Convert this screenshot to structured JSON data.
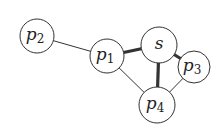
{
  "diagram": {
    "type": "graph",
    "nodes": [
      {
        "id": "p2",
        "base": "p",
        "sub": "2",
        "x": 37,
        "y": 36,
        "r": 17
      },
      {
        "id": "p1",
        "base": "p",
        "sub": "1",
        "x": 107,
        "y": 56,
        "r": 17
      },
      {
        "id": "s",
        "base": "s",
        "sub": "",
        "x": 159,
        "y": 45,
        "r": 18
      },
      {
        "id": "p3",
        "base": "p",
        "sub": "3",
        "x": 194,
        "y": 67,
        "r": 16
      },
      {
        "id": "p4",
        "base": "p",
        "sub": "4",
        "x": 157,
        "y": 105,
        "r": 18
      }
    ],
    "edges": [
      {
        "from": "p2",
        "to": "p1",
        "weight": "thin"
      },
      {
        "from": "p1",
        "to": "s",
        "weight": "thick"
      },
      {
        "from": "s",
        "to": "p4",
        "weight": "thick"
      },
      {
        "from": "s",
        "to": "p3",
        "weight": "thick"
      },
      {
        "from": "p1",
        "to": "p4",
        "weight": "thin"
      },
      {
        "from": "p3",
        "to": "p4",
        "weight": "thin"
      }
    ],
    "colors": {
      "stroke": "#333333",
      "fill": "#ffffff"
    }
  }
}
